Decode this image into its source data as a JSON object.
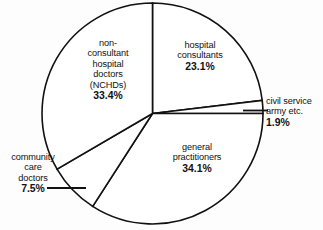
{
  "chart_data": {
    "type": "pie",
    "title": "",
    "subtitle": "",
    "xlabel": "",
    "ylabel": "",
    "legend_position": "none",
    "grid": false,
    "value_unit": "%",
    "categories": [
      "hospital consultants",
      "civil service army etc.",
      "general practitioners",
      "community care doctors",
      "non-consultant hospital doctors (NCHDs)"
    ],
    "values": [
      23.1,
      1.9,
      34.1,
      7.5,
      33.4
    ],
    "slices": [
      {
        "id": "hospital-consultants",
        "lines": [
          "hospital",
          "consultants"
        ],
        "percent_label": "23.1%",
        "value": 23.1,
        "start_angle_deg": 0.0,
        "end_angle_deg": 83.16,
        "color": "#ffffff",
        "stroke": "#111111"
      },
      {
        "id": "civil-service",
        "lines": [
          "civil service",
          "army etc."
        ],
        "percent_label": "1.9%",
        "value": 1.9,
        "start_angle_deg": 83.16,
        "end_angle_deg": 90.0,
        "color": "#ffffff",
        "stroke": "#111111"
      },
      {
        "id": "general-practitioners",
        "lines": [
          "general",
          "practitioners"
        ],
        "percent_label": "34.1%",
        "value": 34.1,
        "start_angle_deg": 90.0,
        "end_angle_deg": 212.76,
        "color": "#ffffff",
        "stroke": "#111111"
      },
      {
        "id": "community-care-doctors",
        "lines": [
          "community",
          "care",
          "doctors"
        ],
        "percent_label": "7.5%",
        "value": 7.5,
        "start_angle_deg": 212.76,
        "end_angle_deg": 239.76,
        "color": "#ffffff",
        "stroke": "#111111"
      },
      {
        "id": "nchds",
        "lines": [
          "non-",
          "consultant",
          "hospital",
          "doctors",
          "(NCHDs)"
        ],
        "percent_label": "33.4%",
        "value": 33.4,
        "start_angle_deg": 239.76,
        "end_angle_deg": 360.0,
        "color": "#ffffff",
        "stroke": "#111111"
      }
    ]
  },
  "labels": {
    "hospital_consultants": {
      "line1": "hospital",
      "line2": "consultants",
      "percent": "23.1%"
    },
    "nchds": {
      "line1": "non-",
      "line2": "consultant",
      "line3": "hospital",
      "line4": "doctors",
      "line5": "(NCHDs)",
      "percent": "33.4%"
    },
    "civil_service": {
      "line1": "civil service",
      "line2": "army etc.",
      "percent": "1.9%"
    },
    "general_practitioners": {
      "line1": "general",
      "line2": "practitioners",
      "percent": "34.1%"
    },
    "community_care": {
      "line1": "community",
      "line2": "care",
      "line3": "doctors",
      "percent": "7.5%"
    }
  }
}
